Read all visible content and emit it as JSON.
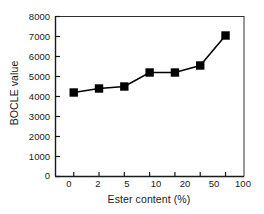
{
  "chart_data": {
    "type": "line",
    "title": "",
    "subtitle": "",
    "xlabel": "Ester content (%)",
    "ylabel": "BOCLE value",
    "categories": [
      "0",
      "2",
      "5",
      "10",
      "20",
      "50",
      "100"
    ],
    "values": [
      4200,
      4400,
      4500,
      5200,
      5200,
      5550,
      7050
    ],
    "series": [
      {
        "name": "BOCLE value",
        "values": [
          4200,
          4400,
          4500,
          5200,
          5200,
          5550,
          7050
        ],
        "marker": "filled-square",
        "color": "#000000"
      }
    ],
    "yticks": [
      0,
      1000,
      2000,
      3000,
      4000,
      5000,
      6000,
      7000,
      8000
    ],
    "ytick_labels": [
      "0",
      "1000",
      "2000",
      "3000",
      "4000",
      "5000",
      "6000",
      "7000",
      "8000"
    ],
    "xtick_labels": [
      "0",
      "2",
      "5",
      "10",
      "20",
      "50",
      "100"
    ],
    "ylim": [
      0,
      8000
    ],
    "grid": false,
    "legend": "none",
    "axis_color": "#1a1a1a",
    "line_color": "#000000",
    "marker_color": "#000000",
    "background": "#ffffff"
  }
}
